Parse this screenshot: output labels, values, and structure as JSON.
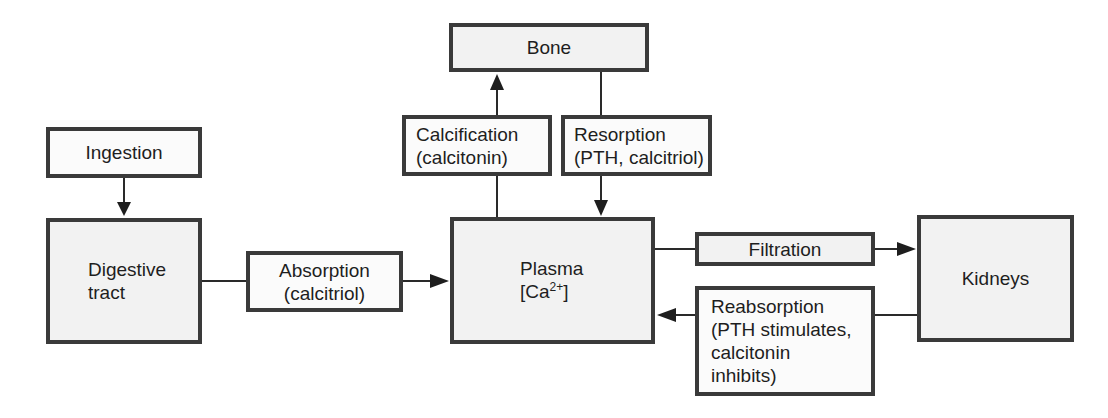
{
  "diagram": {
    "nodes": {
      "ingestion": {
        "label": "Ingestion"
      },
      "digestive": {
        "line1": "Digestive",
        "line2": "tract"
      },
      "absorption": {
        "line1": "Absorption",
        "line2": "(calcitriol)"
      },
      "plasma": {
        "line1": "Plasma",
        "line2_prefix": "[Ca",
        "line2_sup": "2+",
        "line2_suffix": "]"
      },
      "bone": {
        "label": "Bone"
      },
      "calcification": {
        "line1": "Calcification",
        "line2": "(calcitonin)"
      },
      "resorption": {
        "line1": "Resorption",
        "line2": "(PTH, calcitriol)"
      },
      "filtration": {
        "label": "Filtration"
      },
      "kidneys": {
        "label": "Kidneys"
      },
      "reabsorption": {
        "line1": "Reabsorption",
        "line2": "(PTH stimulates,",
        "line3": "calcitonin",
        "line4": "inhibits)"
      }
    },
    "edges": [
      {
        "from": "Ingestion",
        "to": "Digestive tract"
      },
      {
        "from": "Digestive tract",
        "via": "Absorption (calcitriol)",
        "to": "Plasma [Ca2+]"
      },
      {
        "from": "Plasma [Ca2+]",
        "via": "Calcification (calcitonin)",
        "to": "Bone"
      },
      {
        "from": "Bone",
        "via": "Resorption (PTH, calcitriol)",
        "to": "Plasma [Ca2+]"
      },
      {
        "from": "Plasma [Ca2+]",
        "via": "Filtration",
        "to": "Kidneys"
      },
      {
        "from": "Kidneys",
        "via": "Reabsorption (PTH stimulates, calcitonin inhibits)",
        "to": "Plasma [Ca2+]"
      }
    ],
    "colors": {
      "border": "#3a3a3a",
      "fill": "#f2f2f2",
      "line": "#2a2a2a"
    }
  }
}
